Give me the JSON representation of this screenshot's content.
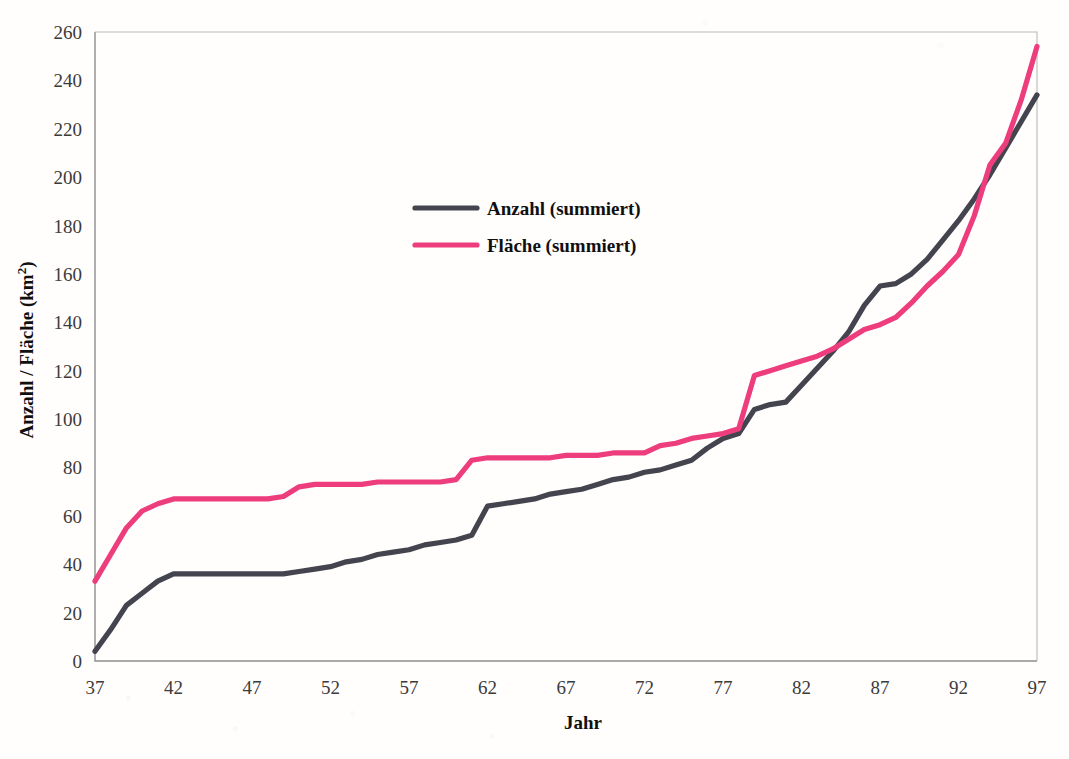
{
  "chart_data": {
    "type": "line",
    "title": "",
    "xlabel": "Jahr",
    "ylabel": "Anzahl / Fläche (km²)",
    "ylabel_base": "Anzahl / Fläche (km",
    "ylabel_sup": "2",
    "ylabel_close": ")",
    "xlim": [
      37,
      97
    ],
    "ylim": [
      0,
      260
    ],
    "grid": false,
    "legend_position": "upper-left-inside",
    "x_ticks": [
      37,
      42,
      47,
      52,
      57,
      62,
      67,
      72,
      77,
      82,
      87,
      92,
      97
    ],
    "y_ticks": [
      0,
      20,
      40,
      60,
      80,
      100,
      120,
      140,
      160,
      180,
      200,
      220,
      240,
      260
    ],
    "x": [
      37,
      38,
      39,
      40,
      41,
      42,
      43,
      44,
      45,
      46,
      47,
      48,
      49,
      50,
      51,
      52,
      53,
      54,
      55,
      56,
      57,
      58,
      59,
      60,
      61,
      62,
      63,
      64,
      65,
      66,
      67,
      68,
      69,
      70,
      71,
      72,
      73,
      74,
      75,
      76,
      77,
      78,
      79,
      80,
      81,
      82,
      83,
      84,
      85,
      86,
      87,
      88,
      89,
      90,
      91,
      92,
      93,
      94,
      95,
      96,
      97
    ],
    "series": [
      {
        "name": "Anzahl (summiert)",
        "color": "#44444f",
        "values": [
          4,
          13,
          23,
          28,
          33,
          36,
          36,
          36,
          36,
          36,
          36,
          36,
          36,
          37,
          38,
          39,
          41,
          42,
          44,
          45,
          46,
          48,
          49,
          50,
          52,
          64,
          65,
          66,
          67,
          69,
          70,
          71,
          73,
          75,
          76,
          78,
          79,
          81,
          83,
          88,
          92,
          94,
          104,
          106,
          107,
          114,
          121,
          128,
          136,
          147,
          155,
          156,
          160,
          166,
          174,
          182,
          191,
          201,
          212,
          223,
          234
        ]
      },
      {
        "name": "Fläche (summiert)",
        "color": "#ed3d7d",
        "values": [
          33,
          44,
          55,
          62,
          65,
          67,
          67,
          67,
          67,
          67,
          67,
          67,
          68,
          72,
          73,
          73,
          73,
          73,
          74,
          74,
          74,
          74,
          74,
          75,
          83,
          84,
          84,
          84,
          84,
          84,
          85,
          85,
          85,
          86,
          86,
          86,
          89,
          90,
          92,
          93,
          94,
          96,
          118,
          120,
          122,
          124,
          126,
          129,
          133,
          137,
          139,
          142,
          148,
          155,
          161,
          168,
          184,
          205,
          214,
          232,
          254
        ]
      }
    ],
    "legend": [
      {
        "label": "Anzahl (summiert)",
        "color": "#44444f"
      },
      {
        "label": "Fläche (summiert)",
        "color": "#ed3d7d"
      }
    ]
  },
  "plot_geometry": {
    "left": 95,
    "right": 1037,
    "top": 32,
    "bottom": 661
  }
}
